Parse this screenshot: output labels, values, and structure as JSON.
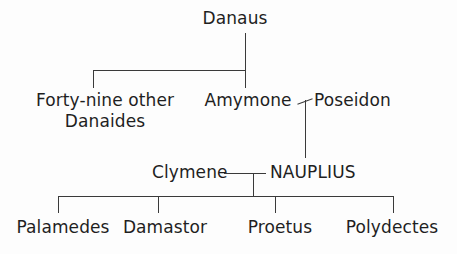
{
  "diagram": {
    "background_color": "#fdfdfd",
    "line_color": "#3a3a3a",
    "text_color": "#1f1f1f",
    "generations": [
      {
        "level": 1,
        "people": [
          "Danaus"
        ]
      },
      {
        "level": 2,
        "people": [
          "Forty-nine other Danaides",
          "Amymone",
          "Poseidon"
        ]
      },
      {
        "level": 3,
        "people": [
          "Clymene",
          "NAUPLIUS"
        ]
      },
      {
        "level": 4,
        "people": [
          "Palamedes",
          "Damastor",
          "Proetus",
          "Polydectes"
        ]
      }
    ]
  },
  "nodes": {
    "danaus": "Danaus",
    "danaides_line1": "Forty-nine other",
    "danaides_line2": "Danaides",
    "amymone": "Amymone",
    "poseidon": "Poseidon",
    "clymene": "Clymene",
    "nauplius": "NAUPLIUS",
    "palamedes": "Palamedes",
    "damastor": "Damastor",
    "proetus": "Proetus",
    "polydectes": "Polydectes"
  }
}
